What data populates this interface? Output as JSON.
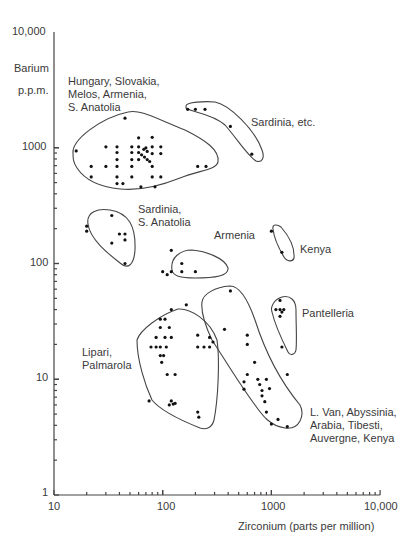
{
  "chart_data": {
    "type": "scatter",
    "title": "",
    "xlabel": "Zirconium (parts per million)",
    "ylabel": "Barium p.p.m.",
    "xscale": "log",
    "yscale": "log",
    "xlim": [
      10,
      10000
    ],
    "ylim": [
      1,
      10000
    ],
    "x_ticks": [
      "10",
      "100",
      "1000",
      "10,000"
    ],
    "y_ticks": [
      "1",
      "10",
      "100",
      "1000",
      "10,000"
    ],
    "grid": false,
    "groups": [
      {
        "name": "Hungary, Slovakia, Melos, Armenia, S. Anatolia",
        "points": [
          [
            45,
            1800
          ],
          [
            16,
            940
          ],
          [
            22,
            690
          ],
          [
            22,
            560
          ],
          [
            30,
            1020
          ],
          [
            30,
            690
          ],
          [
            38,
            1020
          ],
          [
            38,
            910
          ],
          [
            38,
            790
          ],
          [
            38,
            690
          ],
          [
            38,
            560
          ],
          [
            38,
            490
          ],
          [
            43,
            490
          ],
          [
            52,
            1020
          ],
          [
            52,
            910
          ],
          [
            52,
            790
          ],
          [
            52,
            690
          ],
          [
            52,
            560
          ],
          [
            60,
            1220
          ],
          [
            60,
            1020
          ],
          [
            60,
            910
          ],
          [
            60,
            790
          ],
          [
            64,
            870
          ],
          [
            67,
            970
          ],
          [
            68,
            830
          ],
          [
            70,
            1000
          ],
          [
            72,
            790
          ],
          [
            72,
            930
          ],
          [
            76,
            760
          ],
          [
            80,
            1230
          ],
          [
            80,
            1020
          ],
          [
            80,
            890
          ],
          [
            80,
            690
          ],
          [
            80,
            560
          ],
          [
            96,
            1020
          ],
          [
            96,
            890
          ],
          [
            96,
            560
          ],
          [
            85,
            460
          ],
          [
            63,
            460
          ],
          [
            210,
            690
          ],
          [
            250,
            690
          ]
        ]
      },
      {
        "name": "Sardinia, etc.",
        "points": [
          [
            170,
            2150
          ],
          [
            200,
            2150
          ],
          [
            245,
            2150
          ],
          [
            420,
            1530
          ],
          [
            660,
            880
          ]
        ]
      },
      {
        "name": "Sardinia, S. Anatolia",
        "points": [
          [
            20,
            210
          ],
          [
            20,
            190
          ],
          [
            34,
            260
          ],
          [
            40,
            180
          ],
          [
            45,
            180
          ],
          [
            45,
            160
          ],
          [
            34,
            150
          ],
          [
            45,
            100
          ]
        ]
      },
      {
        "name": "Armenia",
        "points": [
          [
            120,
            130
          ],
          [
            150,
            100
          ],
          [
            150,
            85
          ],
          [
            100,
            85
          ],
          [
            110,
            80
          ],
          [
            120,
            85
          ],
          [
            200,
            85
          ]
        ]
      },
      {
        "name": "Kenya",
        "points": [
          [
            1000,
            190
          ],
          [
            1250,
            125
          ]
        ]
      },
      {
        "name": "Pantelleria",
        "points": [
          [
            1200,
            48
          ],
          [
            1100,
            40
          ],
          [
            1200,
            40
          ],
          [
            1250,
            38
          ],
          [
            1300,
            40
          ],
          [
            1200,
            35
          ],
          [
            1250,
            19
          ]
        ]
      },
      {
        "name": "Lipari, Palmarola",
        "points": [
          [
            120,
            40
          ],
          [
            95,
            33
          ],
          [
            105,
            33
          ],
          [
            95,
            28
          ],
          [
            115,
            28
          ],
          [
            87,
            23
          ],
          [
            105,
            23
          ],
          [
            120,
            23
          ],
          [
            87,
            19
          ],
          [
            95,
            19
          ],
          [
            108,
            19
          ],
          [
            95,
            16
          ],
          [
            102,
            16
          ],
          [
            98,
            14
          ],
          [
            78,
            19
          ],
          [
            110,
            11
          ],
          [
            130,
            11
          ],
          [
            120,
            6.5
          ],
          [
            125,
            6.1
          ],
          [
            130,
            6.2
          ],
          [
            115,
            6.0
          ],
          [
            75,
            6.5
          ],
          [
            210,
            5.2
          ],
          [
            215,
            4.7
          ],
          [
            210,
            24
          ],
          [
            210,
            19
          ],
          [
            240,
            19
          ],
          [
            290,
            21
          ]
        ]
      },
      {
        "name": "L. Van, Abyssinia, Arabia, Tibesti, Auvergne, Kenya",
        "points": [
          [
            165,
            44
          ],
          [
            420,
            58
          ],
          [
            270,
            23
          ],
          [
            270,
            19
          ],
          [
            370,
            27
          ],
          [
            600,
            24
          ],
          [
            600,
            20
          ],
          [
            700,
            14
          ],
          [
            600,
            11
          ],
          [
            750,
            10
          ],
          [
            780,
            9
          ],
          [
            900,
            10
          ],
          [
            960,
            8.3
          ],
          [
            820,
            8
          ],
          [
            820,
            7.2
          ],
          [
            870,
            6.4
          ],
          [
            900,
            5.2
          ],
          [
            1000,
            4.1
          ],
          [
            1150,
            4.5
          ],
          [
            1400,
            3.9
          ],
          [
            1400,
            11
          ],
          [
            560,
            9.5
          ],
          [
            560,
            8.2
          ]
        ]
      }
    ],
    "annotations": [
      "Hungary, Slovakia, Melos, Armenia, S. Anatolia",
      "Sardinia, etc.",
      "Sardinia, S. Anatolia",
      "Armenia",
      "Kenya",
      "Pantelleria",
      "Lipari, Palmarola",
      "L. Van, Abyssinia, Arabia, Tibesti, Auvergne, Kenya"
    ],
    "legend": "none"
  },
  "axes": {
    "ylabel_line1": "Barium",
    "ylabel_line2": "p.p.m.",
    "xlabel": "Zirconium (parts per million)",
    "x_ticks": [
      "10",
      "100",
      "1000",
      "10,000"
    ],
    "y_ticks": [
      "10,000",
      "1000",
      "100",
      "10",
      "1"
    ]
  },
  "labels": {
    "hungary": "Hungary, Slovakia,\nMelos, Armenia,\nS. Anatolia",
    "sardinia_etc": "Sardinia, etc.",
    "sardinia_anatolia": "Sardinia,\nS. Anatolia",
    "armenia": "Armenia",
    "kenya": "Kenya",
    "pantelleria": "Pantelleria",
    "lipari": "Lipari,\nPalmarola",
    "lvan": "L. Van, Abyssinia,\nArabia, Tibesti,\nAuvergne, Kenya"
  }
}
